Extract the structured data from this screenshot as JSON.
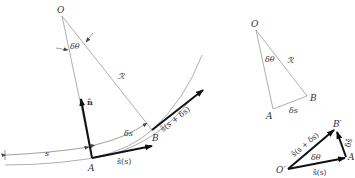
{
  "left_figure": {
    "origin_label": "O",
    "angle_label": "δθ",
    "radius_label": "ℛ",
    "point_a_label": "A",
    "point_b_label": "B",
    "arc_length_label": "δs",
    "path_length_label": "s",
    "normal_vector_label": "n̂",
    "tangent_a_label": "ŝ(s)",
    "tangent_b_label": "ŝ(s + δs)"
  },
  "top_right_figure": {
    "origin_label": "O",
    "angle_label": "δθ",
    "radius_label": "ℛ",
    "point_a_label": "A",
    "point_b_label": "B",
    "arc_length_label": "δs"
  },
  "bottom_right_figure": {
    "origin_label": "O′",
    "point_a_label": "A",
    "point_b_label": "B′",
    "angle_label": "δθ",
    "vector_a_label": "ŝ(s)",
    "vector_b_label": "ŝ(s + δs)",
    "difference_label": "δŝ"
  },
  "colors": {
    "thin_line": "#9a9a9a",
    "thick_vector": "#111111",
    "text": "#333333"
  }
}
